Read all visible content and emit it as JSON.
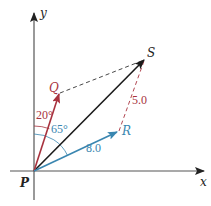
{
  "diagram": {
    "type": "vector-addition",
    "origin_label": "P",
    "axes": {
      "x_label": "x",
      "y_label": "y"
    },
    "vectors": [
      {
        "name": "Q",
        "label": "Q",
        "color": "#a8323e",
        "angle_from_y_label": "20°"
      },
      {
        "name": "R",
        "label": "R",
        "color": "#3a86b0",
        "magnitude_label": "8.0",
        "angle_from_y_label": "65°"
      },
      {
        "name": "S",
        "label": "S",
        "color": "#1a1a1a"
      }
    ],
    "dashed_segments": [
      {
        "from": "Q",
        "to": "S",
        "color": "#1a1a1a"
      },
      {
        "from": "R",
        "to": "S",
        "color": "#a8323e",
        "label": "5.0"
      }
    ],
    "colors": {
      "red": "#a8323e",
      "blue": "#3a86b0",
      "black": "#1a1a1a",
      "axis": "#333333"
    }
  }
}
